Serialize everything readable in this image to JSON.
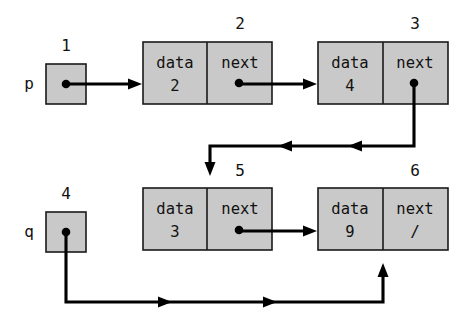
{
  "diagram": {
    "colors": {
      "node_fill": "#c9c9c9",
      "stroke": "#1a1a1a",
      "link": "#000000",
      "background": "#ffffff"
    },
    "pointer_vars": [
      {
        "id": "p",
        "label": "p",
        "address_label": "1",
        "box": {
          "x": 46,
          "y": 64,
          "w": 40,
          "h": 40
        },
        "label_pos": {
          "x": 29,
          "y": 84
        },
        "address_pos": {
          "x": 66,
          "y": 46
        },
        "dot": {
          "x": 66,
          "y": 84
        }
      },
      {
        "id": "q",
        "label": "q",
        "address_label": "4",
        "box": {
          "x": 46,
          "y": 212,
          "w": 40,
          "h": 40
        },
        "label_pos": {
          "x": 29,
          "y": 232
        },
        "address_pos": {
          "x": 66,
          "y": 194
        },
        "dot": {
          "x": 66,
          "y": 232
        }
      }
    ],
    "nodes": [
      {
        "id": "node2",
        "address_label": "2",
        "data_header": "data",
        "next_header": "next",
        "data_value": "2",
        "next_value": "",
        "box": {
          "x": 143,
          "y": 42,
          "w": 129,
          "h": 62
        },
        "divider_x": 207,
        "address_pos": {
          "x": 240,
          "y": 24
        },
        "dot": {
          "x": 239,
          "y": 83
        }
      },
      {
        "id": "node3",
        "address_label": "3",
        "data_header": "data",
        "next_header": "next",
        "data_value": "4",
        "next_value": "",
        "box": {
          "x": 318,
          "y": 42,
          "w": 130,
          "h": 62
        },
        "divider_x": 383,
        "address_pos": {
          "x": 415,
          "y": 24
        },
        "dot": {
          "x": 414,
          "y": 83
        }
      },
      {
        "id": "node5",
        "address_label": "5",
        "data_header": "data",
        "next_header": "next",
        "data_value": "3",
        "next_value": "",
        "box": {
          "x": 143,
          "y": 188,
          "w": 129,
          "h": 62
        },
        "divider_x": 207,
        "address_pos": {
          "x": 240,
          "y": 171
        },
        "dot": {
          "x": 239,
          "y": 230
        }
      },
      {
        "id": "node6",
        "address_label": "6",
        "data_header": "data",
        "next_header": "next",
        "data_value": "9",
        "next_value": "/",
        "box": {
          "x": 318,
          "y": 188,
          "w": 130,
          "h": 62
        },
        "divider_x": 383,
        "address_pos": {
          "x": 415,
          "y": 171
        },
        "dot": null
      }
    ],
    "edges": [
      {
        "id": "edge-p-to-node2",
        "from": "p",
        "to": "node2",
        "kind": "straight-right"
      },
      {
        "id": "edge-node2-to-node3",
        "from": "node2",
        "to": "node3",
        "kind": "straight-right"
      },
      {
        "id": "edge-node3-to-node5",
        "from": "node3",
        "to": "node5",
        "kind": "routed-down-left-down"
      },
      {
        "id": "edge-q-to-node6",
        "from": "q",
        "to": "node6",
        "kind": "routed-down-right-up"
      },
      {
        "id": "edge-node5-to-node6",
        "from": "node5",
        "to": "node6",
        "kind": "straight-right"
      }
    ]
  }
}
